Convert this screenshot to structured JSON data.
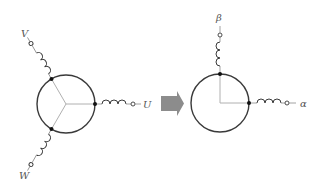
{
  "diagram": {
    "left": {
      "name": "three-phase-winding",
      "labels": {
        "u": "U",
        "v": "V",
        "w": "W"
      }
    },
    "right": {
      "name": "two-phase-winding",
      "labels": {
        "alpha": "α",
        "beta": "β"
      }
    },
    "arrow": {
      "color": "#8c8c8c",
      "direction": "right"
    },
    "colors": {
      "circle": "#3a3a3a",
      "spoke": "#b0b0b0",
      "label": "#555555",
      "node": "#111111"
    }
  }
}
